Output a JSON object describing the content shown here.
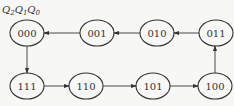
{
  "header": {
    "vars": [
      "Q",
      "Q",
      "Q"
    ],
    "subs": [
      "2",
      "1",
      "0"
    ]
  },
  "states": [
    {
      "id": "000",
      "cx": 27,
      "cy": 33
    },
    {
      "id": "001",
      "cx": 97,
      "cy": 33
    },
    {
      "id": "010",
      "cx": 157,
      "cy": 33
    },
    {
      "id": "011",
      "cx": 216,
      "cy": 33
    },
    {
      "id": "111",
      "cx": 27,
      "cy": 86
    },
    {
      "id": "110",
      "cx": 86,
      "cy": 86
    },
    {
      "id": "101",
      "cx": 153,
      "cy": 86
    },
    {
      "id": "100",
      "cx": 215,
      "cy": 86
    }
  ],
  "transitions": [
    [
      "000",
      "111"
    ],
    [
      "111",
      "110"
    ],
    [
      "110",
      "101"
    ],
    [
      "101",
      "100"
    ],
    [
      "100",
      "011"
    ],
    [
      "011",
      "010"
    ],
    [
      "010",
      "001"
    ],
    [
      "001",
      "000"
    ]
  ],
  "colors": {
    "stroke": "#333333",
    "background": "#f7f7f5"
  }
}
